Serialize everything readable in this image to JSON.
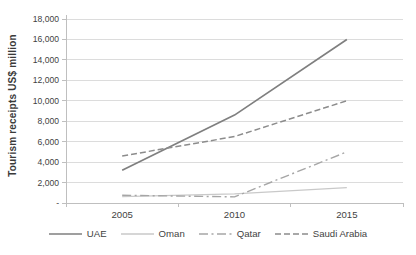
{
  "chart_data": {
    "type": "line",
    "title": "",
    "ylabel": "Tourism receipts US$ million",
    "xlabel": "",
    "categories": [
      "2005",
      "2010",
      "2015"
    ],
    "series": [
      {
        "name": "UAE",
        "values": [
          3200,
          8600,
          16000
        ],
        "color": "#7f7f7f",
        "dash": "",
        "width": 1.7
      },
      {
        "name": "Oman",
        "values": [
          630,
          900,
          1500
        ],
        "color": "#c9c9c9",
        "dash": "",
        "width": 1.3
      },
      {
        "name": "Qatar",
        "values": [
          760,
          600,
          5000
        ],
        "color": "#a6a6a6",
        "dash": "9 3.5 2 3.5",
        "width": 1.4
      },
      {
        "name": "Saudi Arabia",
        "values": [
          4600,
          6500,
          10000
        ],
        "color": "#8c8c8c",
        "dash": "6 3",
        "width": 1.5
      }
    ],
    "ylim": [
      0,
      18000
    ],
    "ytick_step": 2000,
    "ytick_labels": [
      "-",
      "2,000",
      "4,000",
      "6,000",
      "8,000",
      "10,000",
      "12,000",
      "14,000",
      "16,000",
      "18,000"
    ],
    "grid": true,
    "legend_position": "bottom",
    "colors": {
      "gridline": "#dcdcdc",
      "axis": "#bfbfbf",
      "text": "#3f3f3f",
      "background": "#ffffff"
    }
  }
}
